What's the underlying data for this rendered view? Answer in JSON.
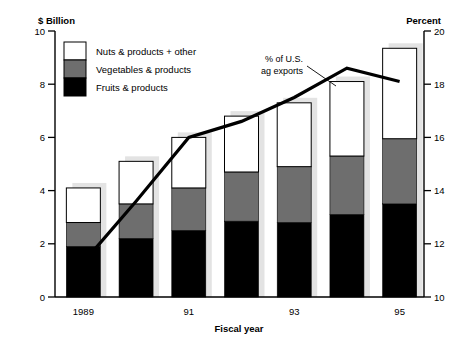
{
  "chart_data": {
    "type": "bar",
    "title": "",
    "subtitle": "",
    "categories": [
      "1989",
      "90",
      "91",
      "92",
      "93",
      "94",
      "95"
    ],
    "xlabel": "Fiscal year",
    "ylabel": "$ Billion",
    "y2label": "Percent",
    "ylim": [
      0,
      10
    ],
    "y2lim": [
      10,
      20
    ],
    "yticks": [
      "0",
      "2",
      "4",
      "6",
      "8",
      "10"
    ],
    "ytick_values": [
      0,
      2,
      4,
      6,
      8,
      10
    ],
    "y2ticks": [
      "10",
      "12",
      "14",
      "16",
      "18",
      "20"
    ],
    "y2tick_values": [
      10,
      12,
      14,
      16,
      18,
      20
    ],
    "xticklabels": [
      "1989",
      "91",
      "93",
      "95"
    ],
    "xticklabel_categories": [
      0,
      2,
      4,
      6
    ],
    "grid": false,
    "stacked": true,
    "legend_position": "upper-left",
    "series": [
      {
        "name": "Fruits & products",
        "color": "#000000",
        "values": [
          1.9,
          2.2,
          2.5,
          2.85,
          2.8,
          3.1,
          3.5
        ]
      },
      {
        "name": "Vegetables & products",
        "color": "#6e6e6e",
        "values": [
          0.9,
          1.3,
          1.6,
          1.85,
          2.1,
          2.2,
          2.45
        ]
      },
      {
        "name": "Nuts & products + other",
        "color": "#ffffff",
        "values": [
          1.3,
          1.6,
          1.9,
          2.1,
          2.4,
          2.8,
          3.4
        ]
      }
    ],
    "series_totals": [
      4.1,
      5.1,
      6.0,
      6.8,
      7.3,
      8.1,
      9.35
    ],
    "line_series": {
      "name": "% of U.S. ag exports",
      "color": "#000000",
      "axis": "right",
      "values": [
        11.3,
        13.6,
        16.0,
        16.6,
        17.5,
        18.6,
        18.1
      ]
    },
    "annotations": [
      {
        "name": "line-annotation",
        "text_line_1": "% of U.S.",
        "text_line_2": "ag exports"
      }
    ]
  },
  "legend": {
    "items": [
      {
        "label": "Nuts & products + other",
        "color": "#ffffff"
      },
      {
        "label": "Vegetables & products",
        "color": "#6e6e6e"
      },
      {
        "label": "Fruits & products",
        "color": "#000000"
      }
    ]
  }
}
